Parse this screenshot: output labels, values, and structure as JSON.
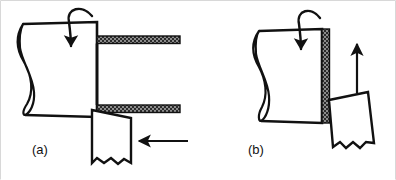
{
  "figure": {
    "background_color": "#ffffff",
    "ink_color": "#111111",
    "shade_color": "#3a3a3a",
    "border": {
      "present": true,
      "sides": "top-left-right",
      "color": "#d8d8d8"
    }
  },
  "panels": [
    {
      "id": "a",
      "label": "(a)",
      "operation_name": "boring",
      "description": "Rotating cylindrical workpiece with hollow tube bore; tool fed axially from the right",
      "elements": {
        "workpiece": {
          "name": "workpiece-cylinder",
          "break_symbol": "teardrop-loop",
          "shading": "none"
        },
        "tube": {
          "name": "hollow-tube",
          "wall_shading": "stippled-dark",
          "open_end": "right"
        },
        "tool": {
          "name": "cutting-tool",
          "shape": "quadrilateral",
          "bottom_edge": "zigzag-break",
          "orientation": "upright"
        },
        "rotation_arrow": {
          "name": "rotation-arrow",
          "shape": "curved-hook",
          "points": "down"
        },
        "feed_arrow": {
          "name": "feed-arrow",
          "direction": "left",
          "orientation": "horizontal"
        }
      }
    },
    {
      "id": "b",
      "label": "(b)",
      "operation_name": "facing",
      "description": "Rotating workpiece with shaded end face; tool fed radially upward along the face",
      "elements": {
        "workpiece": {
          "name": "workpiece-cylinder",
          "break_symbol": "teardrop-loop",
          "shading": "none"
        },
        "face": {
          "name": "workpiece-end-face",
          "shading": "stippled-dark",
          "orientation": "vertical"
        },
        "tool": {
          "name": "cutting-tool",
          "shape": "quadrilateral",
          "bottom_edge": "zigzag-break",
          "orientation": "tilted"
        },
        "rotation_arrow": {
          "name": "rotation-arrow",
          "shape": "curved-hook",
          "points": "down"
        },
        "feed_arrow": {
          "name": "feed-arrow",
          "direction": "up",
          "orientation": "vertical"
        }
      }
    }
  ]
}
